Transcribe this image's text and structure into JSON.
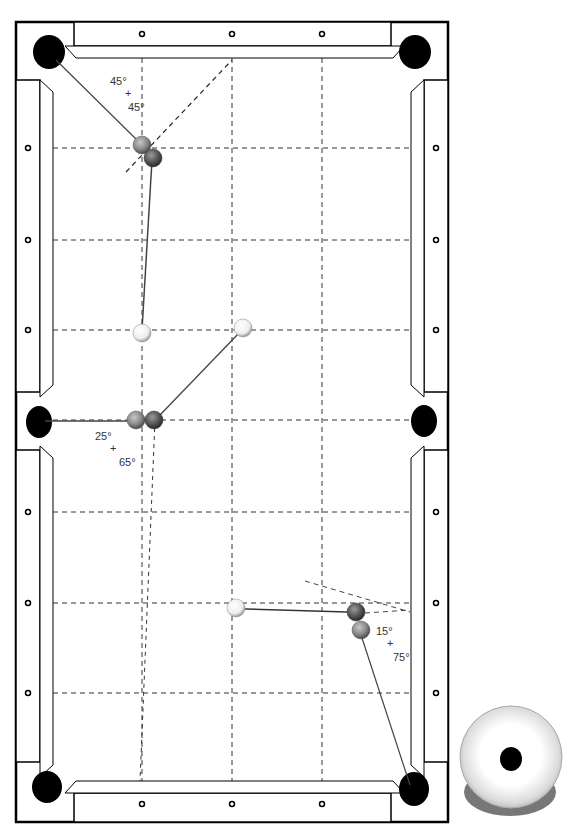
{
  "diagram": {
    "colors": {
      "rail": "#000000",
      "pocket": "#000000",
      "grid": "#333333",
      "cue_ball": "#f4f4f4",
      "object_ball": "#8a8a8a",
      "ghost_ball": "#5a5a5a",
      "shadow": "#777777"
    },
    "shots": [
      {
        "id": "shot-top-left",
        "cut_angle": "45°",
        "plus": "+",
        "complement": "45°"
      },
      {
        "id": "shot-side-left",
        "cut_angle": "25°",
        "plus": "+",
        "complement": "65°"
      },
      {
        "id": "shot-bottom-right",
        "cut_angle": "15°",
        "plus": "+",
        "complement": "75°"
      }
    ],
    "legend": {
      "item": "cue-ball-aim-diagram"
    }
  }
}
